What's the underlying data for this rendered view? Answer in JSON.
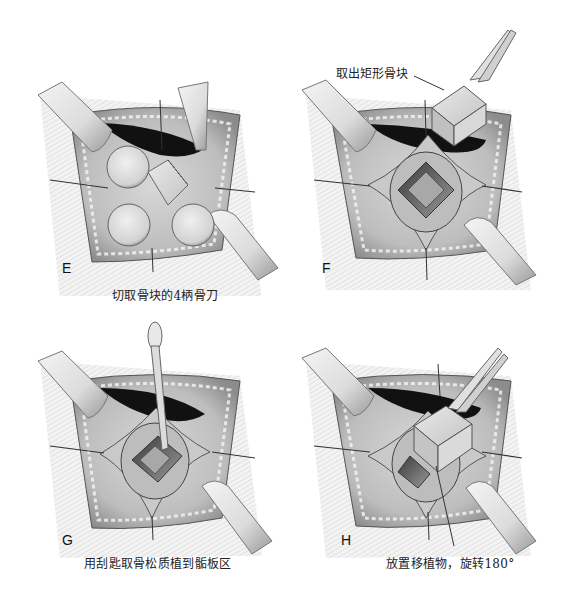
{
  "figure": {
    "panels": [
      {
        "id": "E",
        "letter": "E",
        "caption": "切取骨块的4柄骨刀",
        "description": "Surgical field with four round-headed osteotomes placed around a rectangular bone block"
      },
      {
        "id": "F",
        "letter": "F",
        "caption": "",
        "callout": "取出矩形骨块",
        "description": "Rectangular bone block lifted out with forceps, leaving a square defect"
      },
      {
        "id": "G",
        "letter": "G",
        "caption": "用刮匙取骨松质植到骺板区",
        "description": "Curette harvesting cancellous bone from the square defect"
      },
      {
        "id": "H",
        "letter": "H",
        "caption": "放置移植物，旋转180°",
        "description": "Bone graft placed back into the defect with forceps, rotated 180 degrees"
      }
    ],
    "colors": {
      "background": "#ffffff",
      "ink": "#1a1a1a",
      "tissue_light": "#e6e6e6",
      "tissue_mid": "#b5b5b5",
      "tissue_dark": "#555555",
      "cavity": "#111111"
    }
  }
}
